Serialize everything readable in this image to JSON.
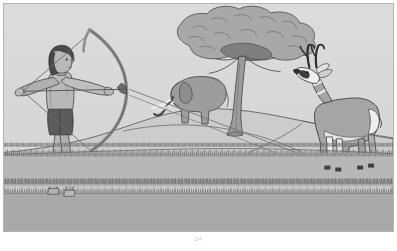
{
  "image": {
    "title": "Archer aiming a bow at a pronghorn antelope on a savanna",
    "medium": "grayscale line-and-wash illustration",
    "caption": "24",
    "frame": {
      "border_color": "#b4b4b4",
      "page_background": "#ffffff",
      "width": 391,
      "height": 229
    },
    "palette": {
      "sky": "#d8d8d8",
      "sky_low": "#cfcfcf",
      "hill_light": "#d2d2d2",
      "hill_mid": "#c4c4c4",
      "ground_near": "#a9a9a9",
      "ground_far": "#bdbdbd",
      "grass_stroke": "#6f6f6f",
      "skin": "#b9b9b9",
      "skin_shadow": "#9a9a9a",
      "hair": "#4a4a4a",
      "loincloth": "#5b5b5b",
      "bow": "#8e8e8e",
      "tree_canopy": "#a8a8a8",
      "tree_canopy_dark": "#8d8d8d",
      "trunk": "#9c9c9c",
      "elephant": "#9d9d9d",
      "tusk": "#f1f1f1",
      "antelope_body": "#a5a5a5",
      "antelope_white": "#f0f0f0",
      "antelope_horn": "#2f2f2f",
      "outline": "#4f4f4f"
    },
    "subjects": [
      {
        "name": "archer",
        "label": "Archer drawing a bow",
        "position": "foreground left",
        "details": "bare-chested figure in profile, dark hair, dark loincloth, arms extended holding a drawn longbow"
      },
      {
        "name": "bow",
        "label": "Longbow with nocked arrow",
        "position": "foreground left-center",
        "details": "recurve longbow, string drawn back, arrow pointing right"
      },
      {
        "name": "antelope",
        "label": "Pronghorn antelope",
        "position": "right midground",
        "details": "tan body with white throat bands, white rump, black branched horns, facing left"
      },
      {
        "name": "elephant",
        "label": "Elephant",
        "position": "center-left midground",
        "details": "grey elephant with white tusks and raised trunk, standing under tree"
      },
      {
        "name": "tree",
        "label": "Acacia tree",
        "position": "center background",
        "details": "broad spreading canopy with forked trunk"
      },
      {
        "name": "hill",
        "label": "Grassy hill",
        "position": "midground",
        "details": "rounded rise with contour line and path"
      },
      {
        "name": "grass",
        "label": "Foreground grass bands",
        "position": "foreground",
        "details": "two horizontal bands of hatched grass tufts"
      }
    ]
  }
}
